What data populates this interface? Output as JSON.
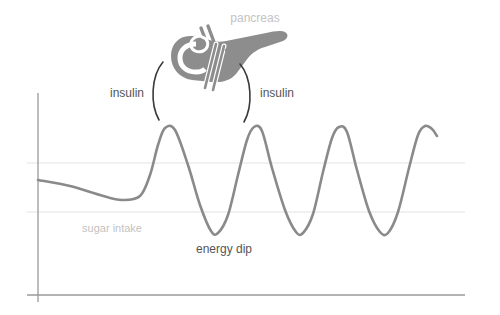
{
  "figure": {
    "background_color": "#ffffff"
  },
  "labels": {
    "pancreas": "pancreas",
    "insulin_left": "insulin",
    "insulin_right": "insulin",
    "sugar_intake": "sugar intake",
    "energy_dip": "energy dip"
  },
  "colors": {
    "curve": "#8a8a8a",
    "axis": "#9a9a9a",
    "gridline": "#ededed",
    "label_dark": "#555555",
    "label_light": "#c3c3c3",
    "organ": "#8d8d8d",
    "organ_light": "#ffffff",
    "bracket": "#3a3a3a"
  },
  "icons": {
    "pancreas": "pancreas-organ-icon",
    "bracket_left": "open-paren-bracket-icon",
    "bracket_right": "close-paren-bracket-icon"
  },
  "chart_data": {
    "type": "line",
    "xlabel": "",
    "ylabel": "",
    "grid": true,
    "legend_position": "none",
    "axis": {
      "y_axis_x": 38,
      "y_axis_top": 93,
      "y_axis_bottom": 302,
      "x_axis_y": 295,
      "x_axis_left": 27,
      "x_axis_right": 465
    },
    "gridlines_y": [
      163,
      212
    ],
    "series": [
      {
        "name": "blood sugar",
        "points": [
          [
            38,
            180
          ],
          [
            70,
            186
          ],
          [
            100,
            195
          ],
          [
            122,
            200
          ],
          [
            140,
            196
          ],
          [
            150,
            175
          ],
          [
            158,
            145
          ],
          [
            165,
            128
          ],
          [
            175,
            130
          ],
          [
            188,
            165
          ],
          [
            200,
            205
          ],
          [
            211,
            231
          ],
          [
            218,
            233
          ],
          [
            228,
            215
          ],
          [
            238,
            175
          ],
          [
            247,
            140
          ],
          [
            254,
            127
          ],
          [
            262,
            131
          ],
          [
            272,
            168
          ],
          [
            285,
            210
          ],
          [
            296,
            232
          ],
          [
            303,
            233
          ],
          [
            313,
            214
          ],
          [
            323,
            172
          ],
          [
            332,
            138
          ],
          [
            339,
            127
          ],
          [
            347,
            132
          ],
          [
            357,
            170
          ],
          [
            369,
            211
          ],
          [
            380,
            232
          ],
          [
            388,
            233
          ],
          [
            398,
            212
          ],
          [
            409,
            168
          ],
          [
            418,
            135
          ],
          [
            425,
            126
          ],
          [
            432,
            129
          ],
          [
            437,
            136
          ]
        ]
      }
    ],
    "annotations": [
      {
        "text": "pancreas",
        "x": 255,
        "y": 18,
        "style": "light"
      },
      {
        "text": "insulin",
        "x": 130,
        "y": 94,
        "style": "dark",
        "align": "right"
      },
      {
        "text": "insulin",
        "x": 262,
        "y": 94,
        "style": "dark",
        "align": "left"
      },
      {
        "text": "sugar intake",
        "x": 125,
        "y": 229,
        "style": "light",
        "align": "right"
      },
      {
        "text": "energy dip",
        "x": 224,
        "y": 250,
        "style": "dark",
        "align": "center"
      }
    ]
  }
}
